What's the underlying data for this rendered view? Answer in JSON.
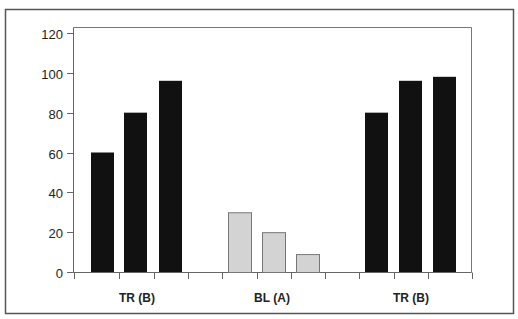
{
  "chart_data": {
    "type": "bar",
    "title": "",
    "xlabel": "",
    "ylabel": "",
    "ylim": [
      0,
      120
    ],
    "yticks": [
      0,
      20,
      40,
      60,
      80,
      100,
      120
    ],
    "grid": false,
    "legend": null,
    "groups": [
      {
        "label": "TR (B)",
        "values": [
          60,
          80,
          96
        ],
        "color": "#111111"
      },
      {
        "label": "BL (A)",
        "values": [
          30,
          20,
          9
        ],
        "color": "#d3d3d3"
      },
      {
        "label": "TR (B)",
        "values": [
          80,
          96,
          98
        ],
        "color": "#111111"
      }
    ],
    "categories": [
      "TR (B)",
      "BL (A)",
      "TR (B)"
    ],
    "series": [
      {
        "name": "bar 1",
        "values": [
          60,
          30,
          80
        ]
      },
      {
        "name": "bar 2",
        "values": [
          80,
          20,
          96
        ]
      },
      {
        "name": "bar 3",
        "values": [
          96,
          9,
          98
        ]
      }
    ]
  },
  "colors": {
    "frame": "#555555",
    "axis": "#666666",
    "dark_bar": "#111111",
    "light_bar": "#d3d3d3",
    "light_bar_border": "#777777"
  }
}
